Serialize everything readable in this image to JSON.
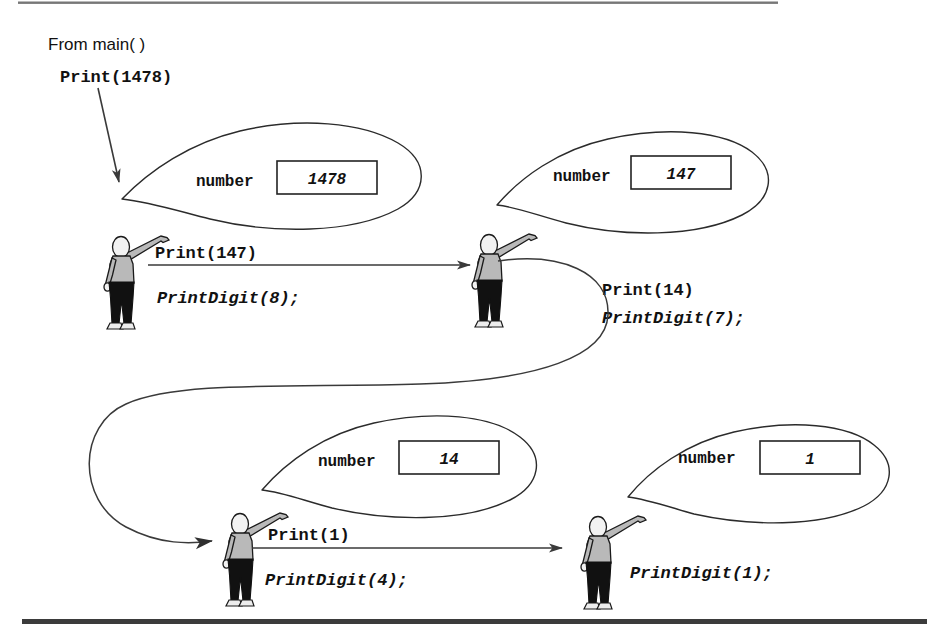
{
  "caption": {
    "from_main": "From main( )",
    "initial_call": "Print(1478)"
  },
  "frames": [
    {
      "id": "frame-1",
      "param_label": "number",
      "param_value": "1478",
      "call_label": "Print(147)",
      "statement": "PrintDigit(8);"
    },
    {
      "id": "frame-2",
      "param_label": "number",
      "param_value": "147",
      "call_label": "Print(14)",
      "statement": "PrintDigit(7);"
    },
    {
      "id": "frame-3",
      "param_label": "number",
      "param_value": "14",
      "call_label": "Print(1)",
      "statement": "PrintDigit(4);"
    },
    {
      "id": "frame-4",
      "param_label": "number",
      "param_value": "1",
      "call_label": "",
      "statement": "PrintDigit(1);"
    }
  ],
  "colors": {
    "ink": "#111111",
    "line": "#3a3a3a",
    "bubble_stroke": "#2b2b2b",
    "shirt": "#b9b9b9",
    "pants": "#111111",
    "background": "#ffffff"
  }
}
